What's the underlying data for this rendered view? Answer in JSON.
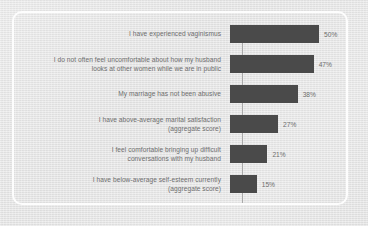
{
  "chart_data": {
    "type": "bar",
    "orientation": "horizontal",
    "title": "",
    "subtitle": "",
    "xlabel": "",
    "ylabel": "",
    "xlim": [
      0,
      55
    ],
    "grid": false,
    "legend": null,
    "bar_color": "#4a4a4a",
    "label_color": "#6e6e6e",
    "background_color": "#e7e7e7",
    "frame_color": "#fdfdfd",
    "axis_color": "#a9a9a9",
    "categories": [
      "I have experienced vaginismus",
      "I do not often feel uncomfortable about how my husband\nlooks at other women while we are in public",
      "My marriage has not been abusive",
      "I have above-average marital satisfaction\n(aggregate score)",
      "I feel comfortable bringing up difficult\nconversations with my husband",
      "I have below-average self-esteem currently\n(aggregate score)"
    ],
    "values": [
      50,
      47,
      38,
      27,
      21,
      15
    ],
    "value_labels": [
      "50%",
      "47%",
      "38%",
      "27%",
      "21%",
      "15%"
    ]
  }
}
